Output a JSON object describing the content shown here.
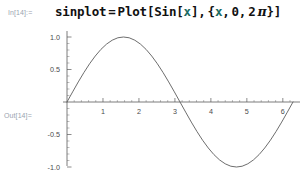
{
  "notebook": {
    "input_cell": {
      "label": "In[14]:=",
      "expression_full": "sinplot = Plot[Sin[x], {x, 0, 2 π}]",
      "tokens": {
        "assign_name": "sinplot",
        "equals": "=",
        "function": "Plot",
        "bracket_open": "[",
        "inner_function": "Sin",
        "inner_bracket_open": "[",
        "var1": "x",
        "inner_bracket_close": "]",
        "comma1": ",",
        "brace_open": "{",
        "var2": "x",
        "comma2": ",",
        "lower": "0",
        "comma3": ",",
        "coeff": "2",
        "pi": "π",
        "brace_close": "}",
        "bracket_close": "]"
      }
    },
    "output_cell": {
      "label": "Out[14]=",
      "graphic_name": "sine-plot"
    }
  },
  "chart_data": {
    "type": "line",
    "title": "",
    "xlabel": "",
    "ylabel": "",
    "function": "Sin[x]",
    "xlim": [
      0,
      6.283185307179586
    ],
    "ylim": [
      -1.0,
      1.0
    ],
    "grid": false,
    "legend": false,
    "x_ticks": [
      1,
      2,
      3,
      4,
      5,
      6
    ],
    "x_tick_labels": [
      "1",
      "2",
      "3",
      "4",
      "5",
      "6"
    ],
    "x_minor_tick_step": 0.2,
    "y_ticks": [
      -1.0,
      -0.5,
      0.5,
      1.0
    ],
    "y_tick_labels": [
      "-1.0",
      "-0.5",
      "0.5",
      "1.0"
    ],
    "y_minor_tick_step": 0.1,
    "axis_color": "#5a5a5a",
    "curve_color": "#5c5c5c",
    "series": [
      {
        "name": "Sin[x]",
        "x": [
          0.0,
          0.157,
          0.314,
          0.471,
          0.628,
          0.785,
          0.942,
          1.1,
          1.257,
          1.414,
          1.571,
          1.728,
          1.885,
          2.042,
          2.199,
          2.356,
          2.513,
          2.67,
          2.827,
          2.985,
          3.142,
          3.299,
          3.456,
          3.613,
          3.77,
          3.927,
          4.084,
          4.241,
          4.398,
          4.555,
          4.712,
          4.869,
          5.027,
          5.184,
          5.341,
          5.498,
          5.655,
          5.812,
          5.969,
          6.126,
          6.283
        ],
        "y": [
          0.0,
          0.156,
          0.309,
          0.454,
          0.588,
          0.707,
          0.809,
          0.891,
          0.951,
          0.988,
          1.0,
          0.988,
          0.951,
          0.891,
          0.809,
          0.707,
          0.588,
          0.454,
          0.309,
          0.156,
          0.0,
          -0.156,
          -0.309,
          -0.454,
          -0.588,
          -0.707,
          -0.809,
          -0.891,
          -0.951,
          -0.988,
          -1.0,
          -0.988,
          -0.951,
          -0.891,
          -0.809,
          -0.707,
          -0.588,
          -0.454,
          -0.309,
          -0.156,
          0.0
        ]
      }
    ]
  }
}
